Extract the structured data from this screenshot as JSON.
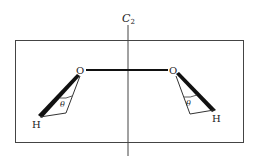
{
  "diagram": {
    "axis": {
      "label": "C",
      "subscript": "2"
    },
    "atoms": {
      "oxygen_left": "O",
      "oxygen_right": "O",
      "hydrogen_left": "H",
      "hydrogen_right": "H"
    },
    "angles": {
      "left": "θ",
      "right": "θ"
    },
    "colors": {
      "line": "#333333",
      "bond": "#111111",
      "background": "#ffffff"
    }
  }
}
